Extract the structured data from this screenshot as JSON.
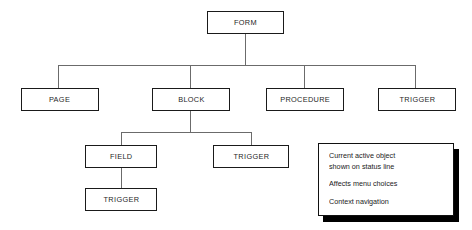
{
  "diagram": {
    "nodes": [
      {
        "id": "form",
        "label": "FORM",
        "level": 1,
        "x": 207,
        "y": 11,
        "w": 77,
        "h": 23
      },
      {
        "id": "page",
        "label": "PAGE",
        "level": 2,
        "x": 21,
        "y": 88,
        "w": 78,
        "h": 23
      },
      {
        "id": "block",
        "label": "BLOCK",
        "level": 2,
        "x": 152,
        "y": 88,
        "w": 78,
        "h": 23
      },
      {
        "id": "procedure",
        "label": "PROCEDURE",
        "level": 2,
        "x": 266,
        "y": 88,
        "w": 78,
        "h": 23
      },
      {
        "id": "trigger-1",
        "label": "TRIGGER",
        "level": 2,
        "x": 378,
        "y": 88,
        "w": 78,
        "h": 23
      },
      {
        "id": "field",
        "label": "FIELD",
        "level": 3,
        "x": 85,
        "y": 145,
        "w": 72,
        "h": 23
      },
      {
        "id": "trigger-2",
        "label": "TRIGGER",
        "level": 3,
        "x": 213,
        "y": 145,
        "w": 76,
        "h": 23
      },
      {
        "id": "trigger-3",
        "label": "TRIGGER",
        "level": 4,
        "x": 85,
        "y": 188,
        "w": 72,
        "h": 23
      }
    ],
    "edges": [
      {
        "from": "form",
        "to": "page"
      },
      {
        "from": "form",
        "to": "block"
      },
      {
        "from": "form",
        "to": "procedure"
      },
      {
        "from": "form",
        "to": "trigger-1"
      },
      {
        "from": "block",
        "to": "field"
      },
      {
        "from": "block",
        "to": "trigger-2"
      },
      {
        "from": "field",
        "to": "trigger-3"
      }
    ],
    "colors": {
      "node_border": "#1a1a1a",
      "node_fill": "#ffffff",
      "connector": "#6b6b6b",
      "note_shadow": "#000000",
      "text": "#1f1f1f"
    }
  },
  "note": {
    "lines": [
      [
        "Current active object",
        "shown on status line"
      ],
      [
        "Affects menu choices"
      ],
      [
        "Context navigation"
      ]
    ],
    "x": 318,
    "y": 143,
    "w": 136,
    "h": 73
  }
}
